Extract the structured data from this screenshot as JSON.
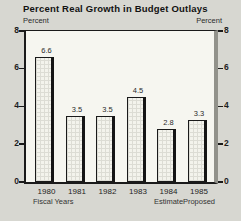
{
  "header": {
    "title": "Percent Real Growth in Budget Outlays",
    "unit_left": "Percent",
    "unit_right": "Percent"
  },
  "chart_data": {
    "type": "bar",
    "title": "Percent Real Growth in Budget Outlays",
    "categories": [
      "1980",
      "1981",
      "1982",
      "1983",
      "1984",
      "1985"
    ],
    "category_sublabels": [
      "Fiscal Years",
      "",
      "",
      "",
      "Estimate",
      "Proposed"
    ],
    "values": [
      6.6,
      3.5,
      3.5,
      4.5,
      2.8,
      3.3
    ],
    "value_labels": [
      "6.6",
      "3.5",
      "3.5",
      "4.5",
      "2.8",
      "3.3"
    ],
    "xlabel": "Fiscal Years",
    "ylabel": "Percent",
    "ylabel_right": "Percent",
    "ylim": [
      0,
      8
    ],
    "yticks": [
      0,
      2,
      4,
      6,
      8
    ],
    "grid": false,
    "legend": null,
    "bar_texture": "graph-paper crosshatch with heavy right-edge shadow"
  },
  "colors": {
    "page_background": "#d7d7d1",
    "plot_background": "#f6f6f0",
    "bar_fill": "#f3f3ec",
    "bar_grid": "#dcdcd4",
    "line": "#1a1a1a",
    "frame_right_shadow": "#92928b",
    "text": "#1c1c1c"
  }
}
